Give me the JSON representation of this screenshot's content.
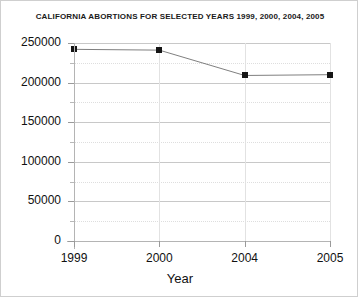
{
  "chart_data": {
    "type": "line",
    "title": "CALIFORNIA ABORTIONS FOR SELECTED YEARS 1999, 2000, 2004, 2005",
    "xlabel": "Year",
    "ylabel": "",
    "categories": [
      "1999",
      "2000",
      "2004",
      "2005"
    ],
    "values": [
      242000,
      241000,
      209000,
      210000
    ],
    "ylim": [
      0,
      250000
    ],
    "y_ticks": [
      0,
      50000,
      100000,
      150000,
      200000,
      250000
    ],
    "y_tick_labels": [
      "0",
      "50000",
      "100000",
      "150000",
      "200000",
      "250000"
    ],
    "y_minor_step": 25000,
    "grid": true,
    "legend": false,
    "series": [
      {
        "name": "California abortions",
        "values": [
          242000,
          241000,
          209000,
          210000
        ],
        "line_color": "#808080",
        "marker_color": "#151515",
        "marker": "square"
      }
    ],
    "colors": {
      "line": "#808080",
      "marker": "#151515",
      "grid_major": "#c8c8c8",
      "grid_minor": "#dedede",
      "axis": "#b4b4b4",
      "text": "#111111",
      "background": "#ffffff",
      "frame": "#cfcfcf"
    }
  }
}
